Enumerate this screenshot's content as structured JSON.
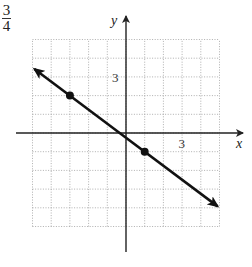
{
  "corner_label": {
    "numerator": "3",
    "denominator": "4"
  },
  "chart_data": {
    "type": "line",
    "title": "",
    "xlabel": "x",
    "ylabel": "y",
    "xlim": [
      -5,
      5
    ],
    "ylim": [
      -5,
      5
    ],
    "grid": true,
    "grid_style": "dotted",
    "tick_labels": {
      "x": [
        "3"
      ],
      "y": [
        "3"
      ]
    },
    "tick_label_positions": {
      "x": [
        3
      ],
      "y": [
        3
      ]
    },
    "series": [
      {
        "name": "line",
        "slope": -0.75,
        "equation": "y = -3/4 x - 1/4",
        "marked_points": [
          {
            "x": -3,
            "y": 2
          },
          {
            "x": 1,
            "y": -1
          }
        ],
        "extent": {
          "x_start": -4.9,
          "x_end": 4.9
        },
        "arrows_both_ends": true
      }
    ]
  }
}
